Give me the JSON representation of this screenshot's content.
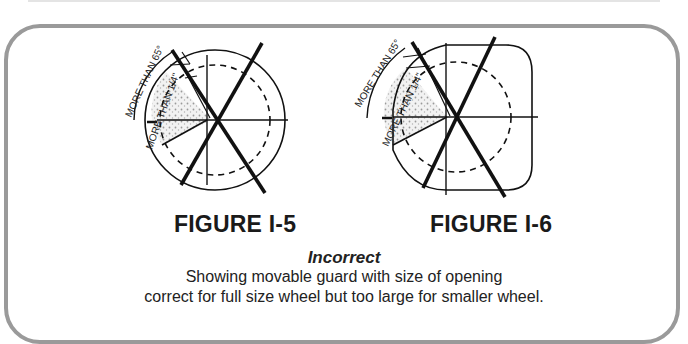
{
  "figures": [
    {
      "id": "I-5",
      "label": "FIGURE I-5",
      "annotations": [
        "MORE THAN 65°",
        "MORE THAN 1/4\""
      ],
      "shape": "circle"
    },
    {
      "id": "I-6",
      "label": "FIGURE I-6",
      "annotations": [
        "MORE THAN 65°",
        "MORE THAN 1/4\""
      ],
      "shape": "rounded-square"
    }
  ],
  "caption": {
    "title": "Incorrect",
    "line1": "Showing movable guard with size of opening",
    "line2": "correct for full size wheel  but too large for smaller wheel."
  }
}
